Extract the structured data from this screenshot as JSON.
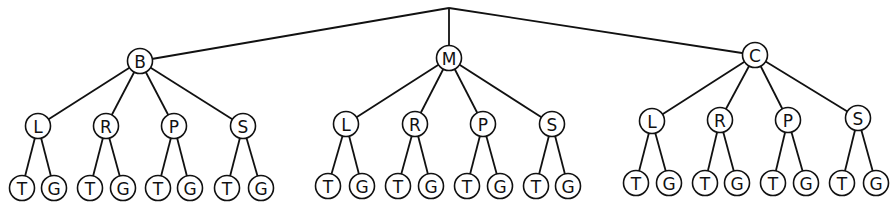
{
  "diagram": {
    "type": "tree",
    "root": {
      "x": 449,
      "y": 8
    },
    "node_radius": 12.5,
    "colors": {
      "stroke": "#111111",
      "fill": "#ffffff",
      "text": "#111111"
    },
    "level1": [
      {
        "label": "B",
        "x": 140,
        "y": 61,
        "children": [
          {
            "label": "L",
            "x": 38,
            "y": 126,
            "children": [
              {
                "label": "T",
                "x": 22,
                "y": 188
              },
              {
                "label": "G",
                "x": 54,
                "y": 188
              }
            ]
          },
          {
            "label": "R",
            "x": 106,
            "y": 126,
            "children": [
              {
                "label": "T",
                "x": 90,
                "y": 188
              },
              {
                "label": "G",
                "x": 123,
                "y": 188
              }
            ]
          },
          {
            "label": "P",
            "x": 174,
            "y": 126,
            "children": [
              {
                "label": "T",
                "x": 158,
                "y": 188
              },
              {
                "label": "G",
                "x": 190,
                "y": 188
              }
            ]
          },
          {
            "label": "S",
            "x": 243,
            "y": 126,
            "children": [
              {
                "label": "T",
                "x": 227,
                "y": 188
              },
              {
                "label": "G",
                "x": 261,
                "y": 188
              }
            ]
          }
        ]
      },
      {
        "label": "M",
        "x": 449,
        "y": 58,
        "children": [
          {
            "label": "L",
            "x": 346,
            "y": 124,
            "children": [
              {
                "label": "T",
                "x": 328,
                "y": 186
              },
              {
                "label": "G",
                "x": 362,
                "y": 186
              }
            ]
          },
          {
            "label": "R",
            "x": 415,
            "y": 124,
            "children": [
              {
                "label": "T",
                "x": 398,
                "y": 186
              },
              {
                "label": "G",
                "x": 431,
                "y": 186
              }
            ]
          },
          {
            "label": "P",
            "x": 483,
            "y": 124,
            "children": [
              {
                "label": "T",
                "x": 467,
                "y": 186
              },
              {
                "label": "G",
                "x": 500,
                "y": 186
              }
            ]
          },
          {
            "label": "S",
            "x": 552,
            "y": 124,
            "children": [
              {
                "label": "T",
                "x": 536,
                "y": 186
              },
              {
                "label": "G",
                "x": 568,
                "y": 186
              }
            ]
          }
        ]
      },
      {
        "label": "C",
        "x": 755,
        "y": 55,
        "children": [
          {
            "label": "L",
            "x": 652,
            "y": 121,
            "children": [
              {
                "label": "T",
                "x": 636,
                "y": 183
              },
              {
                "label": "G",
                "x": 669,
                "y": 183
              }
            ]
          },
          {
            "label": "R",
            "x": 720,
            "y": 120,
            "children": [
              {
                "label": "T",
                "x": 705,
                "y": 183
              },
              {
                "label": "G",
                "x": 737,
                "y": 183
              }
            ]
          },
          {
            "label": "P",
            "x": 788,
            "y": 120,
            "children": [
              {
                "label": "T",
                "x": 773,
                "y": 183
              },
              {
                "label": "G",
                "x": 806,
                "y": 183
              }
            ]
          },
          {
            "label": "S",
            "x": 858,
            "y": 118,
            "children": [
              {
                "label": "T",
                "x": 842,
                "y": 183
              },
              {
                "label": "G",
                "x": 876,
                "y": 183
              }
            ]
          }
        ]
      }
    ]
  }
}
